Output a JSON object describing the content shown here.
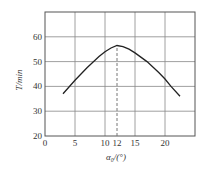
{
  "chart_data": {
    "type": "line",
    "title": "",
    "xlabel": "α₀/(°)",
    "ylabel": "T/min",
    "xlim": [
      0,
      25
    ],
    "ylim": [
      20,
      70
    ],
    "x_ticks": [
      0,
      5,
      10,
      12,
      15,
      20
    ],
    "x_tick_labels": [
      "0",
      "5",
      "10",
      "12",
      "15",
      "20"
    ],
    "y_ticks": [
      20,
      30,
      40,
      50,
      60
    ],
    "y_tick_labels": [
      "20",
      "30",
      "40",
      "50",
      "60"
    ],
    "grid": true,
    "legend": null,
    "series": [
      {
        "name": "T vs α₀",
        "x": [
          3,
          5,
          7,
          9,
          10,
          11,
          12,
          13,
          14,
          15,
          17,
          19,
          20,
          21,
          22.5
        ],
        "y": [
          37,
          42.5,
          47.5,
          52,
          54,
          55.5,
          56.5,
          56,
          55,
          53.5,
          50,
          45.5,
          43,
          40,
          36
        ]
      }
    ],
    "annotations": [
      {
        "type": "dashed-vline",
        "x": 12,
        "from_y": 20,
        "to_y": 56.5,
        "label": "optimum α₀ = 12°"
      }
    ]
  }
}
